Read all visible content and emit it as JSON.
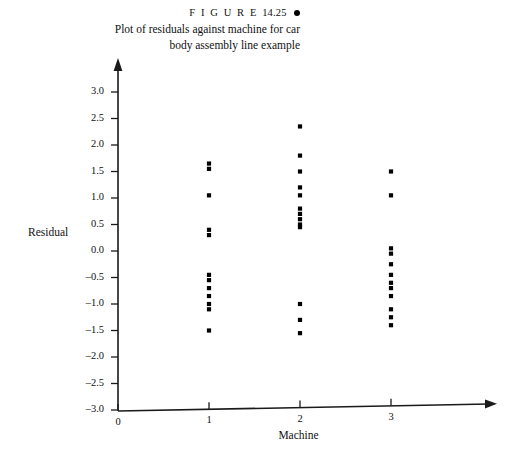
{
  "figure": {
    "label_prefix": "F I G U R E",
    "label_number": "14.25",
    "caption_line1": "Plot of residuals against machine for car",
    "caption_line2": "body assembly line example",
    "bullet_icon": "filled-circle-bullet"
  },
  "chart_data": {
    "type": "scatter",
    "title": "Plot of residuals against machine for car body assembly line example",
    "xlabel": "Machine",
    "ylabel": "Residual",
    "xlim": [
      0,
      3.6
    ],
    "ylim": [
      -3.0,
      3.0
    ],
    "xticks": [
      0,
      1,
      2,
      3
    ],
    "xtick_labels": [
      "0",
      "1",
      "2",
      "3"
    ],
    "yticks": [
      3.0,
      2.5,
      2.0,
      1.5,
      1.0,
      0.5,
      0.0,
      -0.5,
      -1.0,
      -1.5,
      -2.0,
      -2.5,
      -3.0
    ],
    "ytick_labels": [
      "3.0",
      "2.5",
      "2.0",
      "1.5",
      "1.0",
      "0.5",
      "0.0",
      "–0.5",
      "–1.0",
      "–1.5",
      "–2.0",
      "–2.5",
      "–3.0"
    ],
    "grid": false,
    "legend": false,
    "marker": "square",
    "marker_color": "#000000",
    "series": [
      {
        "name": "Machine 1",
        "x": 1,
        "values": [
          1.65,
          1.55,
          1.05,
          0.4,
          0.3,
          -0.45,
          -0.55,
          -0.7,
          -0.85,
          -1.0,
          -1.1,
          -1.5
        ]
      },
      {
        "name": "Machine 2",
        "x": 2,
        "values": [
          2.35,
          1.8,
          1.5,
          1.2,
          1.05,
          0.8,
          0.7,
          0.6,
          0.5,
          0.45,
          -1.0,
          -1.3,
          -1.55
        ]
      },
      {
        "name": "Machine 3",
        "x": 3,
        "values": [
          1.5,
          1.05,
          0.05,
          -0.05,
          -0.25,
          -0.45,
          -0.6,
          -0.7,
          -0.85,
          -1.1,
          -1.25,
          -1.4
        ]
      }
    ]
  }
}
